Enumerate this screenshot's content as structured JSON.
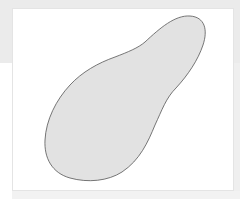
{
  "canvas": {
    "width": 240,
    "height": 199,
    "background_color": "#ebebeb",
    "panel_color": "#ffffff",
    "panel_border_color": "#e4e4e4"
  },
  "shape": {
    "type": "blob",
    "description": "footprint-shaped closed outline",
    "fill_color": "#e2e2e2",
    "stroke_color": "#555555",
    "outline_points": [
      [
        190,
        16
      ],
      [
        204,
        35
      ],
      [
        190,
        70
      ],
      [
        163,
        100
      ],
      [
        150,
        130
      ],
      [
        135,
        158
      ],
      [
        95,
        180
      ],
      [
        55,
        170
      ],
      [
        45,
        145
      ],
      [
        47,
        128
      ],
      [
        60,
        100
      ],
      [
        80,
        75
      ],
      [
        100,
        62
      ],
      [
        130,
        52
      ],
      [
        145,
        42
      ]
    ]
  }
}
